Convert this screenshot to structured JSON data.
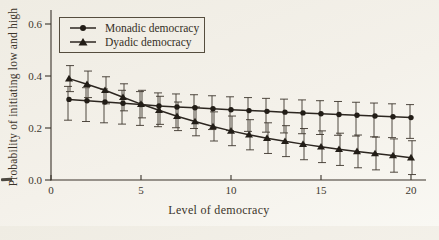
{
  "figure": {
    "kind": "scanned-book-figure"
  },
  "chart_data": {
    "type": "line",
    "title": "",
    "xlabel": "Level of democracy",
    "ylabel": "Probability of initiating low and high",
    "grid": false,
    "legend_position": "top-left-inside",
    "error_bars": true,
    "xlim": [
      0,
      20.8
    ],
    "ylim": [
      0,
      0.65
    ],
    "x_ticks": [
      0,
      5,
      10,
      15,
      20
    ],
    "x_tick_labels": [
      "0",
      "5",
      "10",
      "15",
      "20"
    ],
    "y_ticks": [
      0,
      0.2,
      0.4,
      0.6
    ],
    "y_tick_labels": [
      "0.0",
      "0.2",
      "0.4",
      "0.6"
    ],
    "x": [
      1,
      2,
      3,
      4,
      5,
      6,
      7,
      8,
      9,
      10,
      11,
      12,
      13,
      14,
      15,
      16,
      17,
      18,
      19,
      20
    ],
    "series": [
      {
        "name": "Monadic democracy",
        "marker": "circle",
        "values": [
          0.31,
          0.305,
          0.3,
          0.295,
          0.29,
          0.285,
          0.281,
          0.278,
          0.274,
          0.27,
          0.267,
          0.264,
          0.261,
          0.258,
          0.255,
          0.252,
          0.249,
          0.246,
          0.243,
          0.24
        ],
        "lower": [
          0.23,
          0.225,
          0.22,
          0.215,
          0.21,
          0.205,
          0.201,
          0.198,
          0.194,
          0.19,
          0.187,
          0.184,
          0.181,
          0.178,
          0.175,
          0.172,
          0.169,
          0.166,
          0.163,
          0.16
        ],
        "upper": [
          0.36,
          0.355,
          0.35,
          0.345,
          0.34,
          0.335,
          0.331,
          0.328,
          0.324,
          0.32,
          0.317,
          0.314,
          0.311,
          0.308,
          0.305,
          0.302,
          0.299,
          0.296,
          0.293,
          0.29
        ]
      },
      {
        "name": "Dyadic democracy",
        "marker": "triangle",
        "values": [
          0.39,
          0.368,
          0.345,
          0.318,
          0.292,
          0.268,
          0.245,
          0.225,
          0.206,
          0.189,
          0.174,
          0.161,
          0.149,
          0.138,
          0.128,
          0.118,
          0.11,
          0.102,
          0.094,
          0.086
        ],
        "lower": [
          0.34,
          0.317,
          0.293,
          0.266,
          0.239,
          0.214,
          0.19,
          0.17,
          0.15,
          0.132,
          0.116,
          0.102,
          0.09,
          0.078,
          0.067,
          0.056,
          0.047,
          0.039,
          0.03,
          0.021
        ],
        "upper": [
          0.44,
          0.419,
          0.397,
          0.37,
          0.345,
          0.322,
          0.3,
          0.281,
          0.262,
          0.246,
          0.232,
          0.22,
          0.209,
          0.198,
          0.189,
          0.18,
          0.173,
          0.165,
          0.158,
          0.151
        ]
      }
    ],
    "ink_color": "#2c2620",
    "paper_color": "#f2efe8"
  }
}
